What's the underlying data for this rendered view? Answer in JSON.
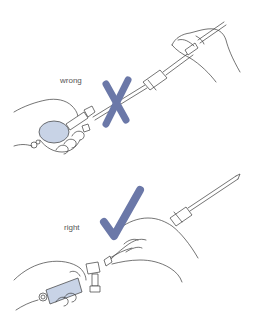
{
  "panels": [
    {
      "id": "wrong",
      "label": "wrong",
      "mark": "x-mark",
      "description": "Pipette bulb attached while pipette is held from far end"
    },
    {
      "id": "right",
      "label": "right",
      "mark": "check-mark",
      "description": "Pipette held near top while bulb is brought to it"
    }
  ],
  "colors": {
    "mark": "#6b78a8",
    "bulb": "#c8d3e6",
    "line": "#3a3a3a",
    "label": "#555555",
    "background": "#ffffff"
  }
}
